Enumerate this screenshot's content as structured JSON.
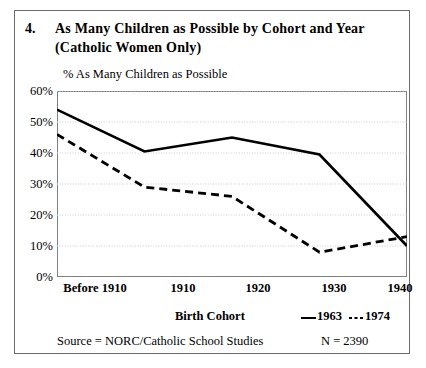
{
  "figure": {
    "number": "4.",
    "title": "As Many Children as Possible by Cohort and Year (Catholic Women Only)",
    "source_note": "Source = NORC/Catholic School Studies",
    "n_note": "N = 2390"
  },
  "legend": {
    "series_1_label": "1963",
    "series_1_dash": "—",
    "series_2_label": "1974",
    "series_2_dash": "- - -"
  },
  "colors": {
    "line": "#000000",
    "frame": "#808080",
    "grid": "#cccccc",
    "outer_border": "#6b6b6b",
    "background": "#ffffff"
  },
  "chart_data": {
    "type": "line",
    "title": "As Many Children as Possible by Cohort and Year (Catholic Women Only)",
    "xlabel": "Birth Cohort",
    "ylabel": "% As Many Children as Possible",
    "categories": [
      "Before 1910",
      "1910",
      "1920",
      "1930",
      "1940"
    ],
    "ylim": [
      0,
      60
    ],
    "yticks": [
      0,
      10,
      20,
      30,
      40,
      50,
      60
    ],
    "ytick_labels": [
      "0%",
      "10%",
      "20%",
      "30%",
      "40%",
      "50%",
      "60%"
    ],
    "grid": true,
    "legend_position": "below-right",
    "series": [
      {
        "name": "1963",
        "style": "solid",
        "values": [
          54,
          40.5,
          45,
          39.5,
          10
        ]
      },
      {
        "name": "1974",
        "style": "dashed",
        "values": [
          46,
          29,
          26,
          8,
          13
        ]
      }
    ]
  }
}
